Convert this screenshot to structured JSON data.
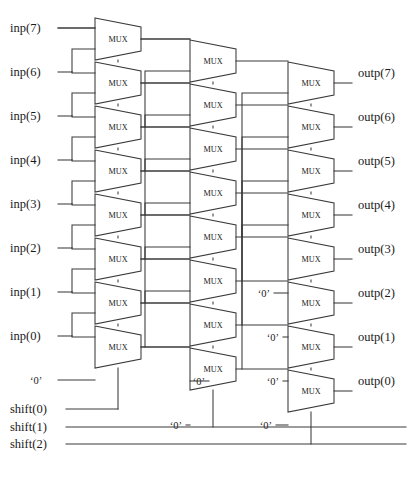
{
  "diagram": {
    "mux_label": "MUX",
    "zero_label": "‘0’",
    "colors": {
      "wire": "#3a3a3a",
      "box_fill": "#ffffff",
      "text": "#1a1a1a",
      "background": "#ffffff"
    },
    "inputs": [
      {
        "name": "inp(7)",
        "y": 28
      },
      {
        "name": "inp(6)",
        "y": 72
      },
      {
        "name": "inp(5)",
        "y": 116
      },
      {
        "name": "inp(4)",
        "y": 160
      },
      {
        "name": "inp(3)",
        "y": 204
      },
      {
        "name": "inp(2)",
        "y": 248
      },
      {
        "name": "inp(1)",
        "y": 292
      },
      {
        "name": "inp(0)",
        "y": 336
      }
    ],
    "ground_input": {
      "name": "‘0’",
      "y": 380
    },
    "controls": [
      {
        "name": "shift(0)",
        "y": 409
      },
      {
        "name": "shift(1)",
        "y": 427
      },
      {
        "name": "shift(2)",
        "y": 444
      }
    ],
    "outputs": [
      {
        "name": "outp(7)",
        "y": 73
      },
      {
        "name": "outp(6)",
        "y": 117
      },
      {
        "name": "outp(5)",
        "y": 161
      },
      {
        "name": "outp(4)",
        "y": 205
      },
      {
        "name": "outp(3)",
        "y": 249
      },
      {
        "name": "outp(2)",
        "y": 293
      },
      {
        "name": "outp(1)",
        "y": 337
      },
      {
        "name": "outp(0)",
        "y": 381
      }
    ],
    "stages": [
      {
        "id": "stage-1",
        "control": "shift(0)",
        "mux_count": 8,
        "x": 95,
        "top": 18,
        "pitch": 44,
        "zero_feeds": 1
      },
      {
        "id": "stage-2",
        "control": "shift(1)",
        "mux_count": 8,
        "x": 190,
        "top": 40,
        "pitch": 44,
        "zero_feeds": 2
      },
      {
        "id": "stage-3",
        "control": "shift(2)",
        "mux_count": 8,
        "x": 288,
        "top": 62,
        "pitch": 44,
        "zero_feeds": 4
      }
    ],
    "mux_shape": {
      "width": 46,
      "top_height": 42,
      "bottom_inset": 9
    },
    "stage2_zero_labels": [
      {
        "text": "‘0’",
        "x": 205,
        "y": 381
      },
      {
        "text": "‘0’",
        "x": 182,
        "y": 425
      }
    ],
    "stage3_zero_labels": [
      {
        "text": "‘0’",
        "x": 270,
        "y": 293
      },
      {
        "text": "‘0’",
        "x": 279,
        "y": 337
      },
      {
        "text": "‘0’",
        "x": 279,
        "y": 381
      },
      {
        "text": "‘0’",
        "x": 272,
        "y": 425
      }
    ]
  }
}
